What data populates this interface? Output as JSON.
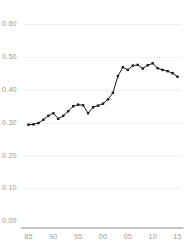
{
  "chart_data": {
    "type": "line",
    "title": "",
    "subtitle": "",
    "xlabel": "",
    "ylabel": "",
    "xlim": [
      1984.2,
      2015.8
    ],
    "ylim": [
      0.0,
      0.62
    ],
    "grid": true,
    "legend": null,
    "marker": "square",
    "line_color": "#1a1a1a",
    "marker_color": "#1a1a1a",
    "grid_color": "#ececec",
    "axis_color": "#8c8c8c",
    "tick_label_color": "#9a9a9a",
    "background": "#ffffff",
    "y_ticks": [
      0.0,
      0.1,
      0.2,
      0.3,
      0.4,
      0.5,
      0.6
    ],
    "y_tick_labels": [
      "0.00",
      "0.10",
      "0.20",
      "0.30",
      "0.40",
      "0.50",
      "0.60"
    ],
    "x_ticks": [
      1985,
      1990,
      1995,
      2000,
      2005,
      2010,
      2015
    ],
    "x_tick_labels": [
      "85",
      "90",
      "95",
      "00",
      "05",
      "10",
      "15"
    ],
    "x": [
      1985,
      1986,
      1987,
      1988,
      1989,
      1990,
      1991,
      1992,
      1993,
      1994,
      1995,
      1996,
      1997,
      1998,
      1999,
      2000,
      2001,
      2002,
      2003,
      2004,
      2005,
      2006,
      2007,
      2008,
      2009,
      2010,
      2011,
      2012,
      2013,
      2014,
      2015
    ],
    "values": [
      0.295,
      0.296,
      0.3,
      0.31,
      0.322,
      0.33,
      0.313,
      0.322,
      0.336,
      0.351,
      0.356,
      0.354,
      0.33,
      0.348,
      0.353,
      0.359,
      0.372,
      0.392,
      0.443,
      0.47,
      0.462,
      0.475,
      0.477,
      0.466,
      0.476,
      0.482,
      0.467,
      0.462,
      0.458,
      0.452,
      0.441
    ],
    "series": [
      {
        "name": "series-1",
        "values": [
          0.295,
          0.296,
          0.3,
          0.31,
          0.322,
          0.33,
          0.313,
          0.322,
          0.336,
          0.351,
          0.356,
          0.354,
          0.33,
          0.348,
          0.353,
          0.359,
          0.372,
          0.392,
          0.443,
          0.47,
          0.462,
          0.475,
          0.477,
          0.466,
          0.476,
          0.482,
          0.467,
          0.462,
          0.458,
          0.452,
          0.441
        ]
      }
    ]
  }
}
